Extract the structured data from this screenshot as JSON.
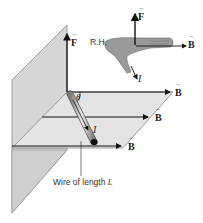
{
  "figure": {
    "labels": {
      "force": "F",
      "field_top": "B",
      "field_middle": "B",
      "field_bottom": "B",
      "hand_force": "F",
      "hand_field": "B",
      "hand_current": "I",
      "wire_current": "I",
      "right_hand": "R.H.",
      "angle": "θ",
      "wire_caption_prefix": "Wire of length",
      "wire_caption_var": "L"
    },
    "colors": {
      "plane_fill": "#d9d9d9",
      "plane_edge": "#8a8a8a",
      "arrow": "#111111",
      "hand_fill": "#9a9a9a",
      "text": "#1a1a1a"
    }
  }
}
